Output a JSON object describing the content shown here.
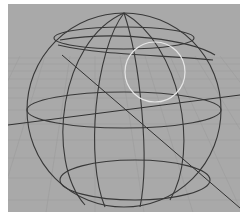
{
  "viewport": {
    "label": "3D Viewport",
    "background": "#a9a9a9",
    "grid_color": "#9c9c9c",
    "wire_color": "#3a3a3a",
    "selection_color": "#e6e6e6"
  },
  "scene": {
    "object": "wireframe-sphere",
    "selection": "circle-select-cursor"
  }
}
